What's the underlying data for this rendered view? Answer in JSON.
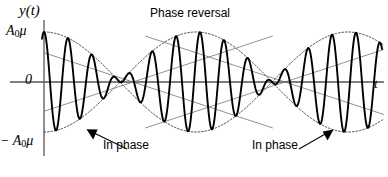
{
  "figure": {
    "width": 388,
    "height": 177,
    "background": "#ffffff",
    "ink": "#000000"
  },
  "labels": {
    "y_axis_title": "y(t)",
    "amplitude_positive_prefix": "A",
    "amplitude_positive_subscript": "0",
    "amplitude_positive_suffix": "μ",
    "amplitude_negative_prefix": "− A",
    "amplitude_negative_subscript": "0",
    "amplitude_negative_suffix": "μ",
    "zero": "0",
    "x_axis_title": "t",
    "phase_reversal": "Phase reversal",
    "in_phase_left": "In phase",
    "in_phase_right": "In phase"
  },
  "chart_data": {
    "type": "line",
    "title": "",
    "xlabel": "t",
    "ylabel": "y(t)",
    "xlim": [
      0,
      388
    ],
    "ylim": [
      -1.12,
      1.12
    ],
    "grid": false,
    "legend": "none",
    "axes": {
      "origin_px": {
        "x": 44,
        "y": 82
      },
      "zero_line_y_px": 82,
      "amplitude_px": 50,
      "x_axis_start_px": 44,
      "x_axis_end_px": 384,
      "y_axis_top_px": 20,
      "y_axis_bottom_px": 156,
      "y_ticks": [
        {
          "value": 1,
          "label": "A0μ",
          "y_px": 32
        },
        {
          "value": 0,
          "label": "0",
          "y_px": 82
        },
        {
          "value": -1,
          "label": "− A0μ",
          "y_px": 143
        }
      ]
    },
    "signal": {
      "description": "Amplitude-modulated beat waveform y(t) = A0*mu*cos(2*pi*t/T_env)*cos(2*pi*t/T_carrier)",
      "carrier_period_px": 24.0,
      "carrier_phase_deg": 0,
      "envelope_type": "cosine",
      "envelope_half_period_px": 152,
      "envelope_phase_origin_px": 44,
      "peak_amplitude": 1.0,
      "start_x_px": 42,
      "end_x_px": 382,
      "stroke_width": 1.9
    },
    "envelope": {
      "description": "Dotted upper and lower envelopes |A0*mu*cos(...)| that cross at the nodes",
      "style": "dotted",
      "stroke_width": 1.0,
      "dash": "1.6 1.9",
      "crossing_nodes_px": [
        133,
        285
      ],
      "antinodes_px": [
        44,
        209,
        361
      ]
    },
    "annotations": [
      {
        "name": "phase-reversal",
        "text": "Phase reversal",
        "x_px": 209,
        "y_px": 12,
        "target_px": {
          "x": 209,
          "y": 30
        }
      },
      {
        "name": "in-phase-left",
        "text": "In phase",
        "x_px": 135,
        "y_px": 145,
        "arrow_from_px": {
          "x": 127,
          "y": 149
        },
        "arrow_to_px": {
          "x": 88,
          "y": 130
        }
      },
      {
        "name": "in-phase-right",
        "text": "In phase",
        "x_px": 284,
        "y_px": 145,
        "arrow_from_px": {
          "x": 299,
          "y": 149
        },
        "arrow_to_px": {
          "x": 330,
          "y": 130
        }
      }
    ],
    "series": [
      {
        "name": "y(t) modulated carrier",
        "x": [
          44,
          50,
          56,
          62,
          68,
          74,
          80,
          86,
          92,
          98,
          104,
          110,
          116,
          122,
          128,
          133,
          140,
          146,
          152,
          158,
          164,
          170,
          176,
          182,
          188,
          194,
          200,
          206,
          209,
          215,
          221,
          227,
          233,
          239,
          245,
          251,
          257,
          263,
          269,
          275,
          281,
          285,
          291,
          297,
          303,
          309,
          315,
          321,
          327,
          333,
          339,
          345,
          351,
          357,
          363,
          369,
          375,
          381
        ],
        "values": [
          1.0,
          0.0,
          -0.98,
          0.0,
          0.93,
          0.0,
          -0.87,
          0.0,
          0.78,
          0.0,
          -0.68,
          0.0,
          0.56,
          0.0,
          -0.43,
          0.0,
          0.24,
          0.0,
          -0.1,
          0.0,
          0.05,
          0.0,
          -0.2,
          0.0,
          0.36,
          0.0,
          -0.51,
          0.0,
          0.63,
          0.0,
          0.74,
          0.0,
          -0.84,
          0.0,
          0.92,
          0.0,
          -0.97,
          0.0,
          1.0,
          0.0,
          -0.99,
          0.0,
          0.95,
          0.0,
          -0.88,
          0.0,
          0.79,
          0.0,
          -0.67,
          0.0,
          0.54,
          0.0,
          -0.39,
          0.0,
          0.23,
          0.0,
          -0.07,
          0.0
        ]
      },
      {
        "name": "upper envelope",
        "x": [
          44,
          88,
          133,
          171,
          209,
          247,
          285,
          323,
          361,
          384
        ],
        "values": [
          1.0,
          0.71,
          0.0,
          0.71,
          1.0,
          0.71,
          0.0,
          0.71,
          1.0,
          0.93
        ]
      },
      {
        "name": "lower envelope",
        "x": [
          44,
          88,
          133,
          171,
          209,
          247,
          285,
          323,
          361,
          384
        ],
        "values": [
          -1.0,
          -0.71,
          0.0,
          -0.71,
          -1.0,
          -0.71,
          0.0,
          -0.71,
          -1.0,
          -0.93
        ]
      }
    ]
  }
}
